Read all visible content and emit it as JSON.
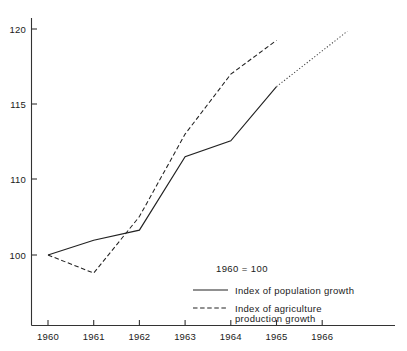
{
  "chart_data": {
    "type": "line",
    "title": "",
    "subtitle": "",
    "base_note": "1960 = 100",
    "xlabel": "",
    "ylabel": "",
    "x": [
      1960,
      1961,
      1962,
      1963,
      1964,
      1965,
      1966
    ],
    "xtick_labels": [
      "1960",
      "1961",
      "1962",
      "1963",
      "1964",
      "1965",
      "1966"
    ],
    "ytick_labels": [
      "100",
      "110",
      "115",
      "120"
    ],
    "ytick_values": [
      100,
      110,
      115,
      120
    ],
    "xlim": [
      1960,
      1966.7
    ],
    "ylim": [
      95.5,
      120.5
    ],
    "grid": false,
    "legend_position": "inside-lower-right",
    "series": [
      {
        "name": "Index of population growth",
        "style": "solid",
        "x": [
          1960,
          1961,
          1962,
          1963,
          1964,
          1965
        ],
        "values": [
          100.0,
          101.3,
          102.2,
          108.7,
          110.1,
          114.9
        ],
        "extrapolation": {
          "style": "dotted",
          "x": [
            1965,
            1966.55
          ],
          "values": [
            114.9,
            119.8
          ]
        }
      },
      {
        "name": "Index of agriculture production growth",
        "style": "dashed",
        "x": [
          1960,
          1961,
          1962,
          1963,
          1964,
          1965
        ],
        "values": [
          100.0,
          98.4,
          103.4,
          110.7,
          116.0,
          119.0
        ]
      }
    ]
  },
  "legend": {
    "note": "1960 = 100",
    "entries": [
      {
        "label": "Index of population growth",
        "style": "solid"
      },
      {
        "label": "Index of agriculture\nproduction growth",
        "style": "dashed",
        "line1": "Index  of  agriculture",
        "line2": "production  growth"
      }
    ]
  },
  "axes": {
    "x_ticks": [
      "1960",
      "1961",
      "1962",
      "1963",
      "1964",
      "1965",
      "1966"
    ],
    "y_ticks": [
      "120",
      "115",
      "110",
      "100"
    ]
  },
  "colors": {
    "axis": "#333333",
    "line": "#222222",
    "background": "#ffffff",
    "text": "#1a1a1a"
  }
}
